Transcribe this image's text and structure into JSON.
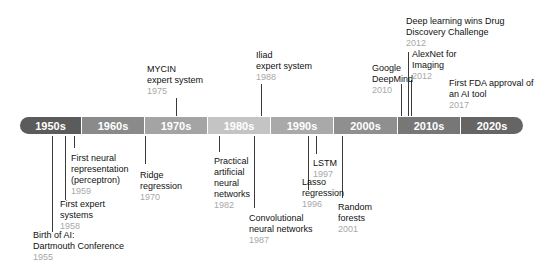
{
  "decades": [
    {
      "label": "1950s",
      "color": "#5b5b5b"
    },
    {
      "label": "1960s",
      "color": "#8a8a8a"
    },
    {
      "label": "1970s",
      "color": "#a4a4a4"
    },
    {
      "label": "1980s",
      "color": "#c4c4c4"
    },
    {
      "label": "1990s",
      "color": "#a9a9a9"
    },
    {
      "label": "2000s",
      "color": "#8f8f8f"
    },
    {
      "label": "2010s",
      "color": "#777777"
    },
    {
      "label": "2020s",
      "color": "#656565"
    }
  ],
  "events_above": [
    {
      "lines": [
        "MYCIN",
        "expert system"
      ],
      "year": "1975"
    },
    {
      "lines": [
        "Iliad",
        "expert system"
      ],
      "year": "1988"
    },
    {
      "lines": [
        "Google",
        "DeepMind"
      ],
      "year": "2010"
    },
    {
      "lines": [
        "Deep learning wins Drug",
        "Discovery Challenge"
      ],
      "year": "2012"
    },
    {
      "lines": [
        "AlexNet for",
        "Imaging"
      ],
      "year": "2012"
    },
    {
      "lines": [
        "First FDA approval of",
        "an AI tool"
      ],
      "year": "2017"
    }
  ],
  "events_below": [
    {
      "lines": [
        "Birth of AI:",
        "Dartmouth Conference"
      ],
      "year": "1955"
    },
    {
      "lines": [
        "First expert",
        "systems"
      ],
      "year": "1958"
    },
    {
      "lines": [
        "First neural",
        "representation",
        "(perceptron)"
      ],
      "year": "1959"
    },
    {
      "lines": [
        "Ridge",
        "regression"
      ],
      "year": "1970"
    },
    {
      "lines": [
        "Practical",
        "artificial",
        "neural",
        "networks"
      ],
      "year": "1982"
    },
    {
      "lines": [
        "Convolutional",
        "neural networks"
      ],
      "year": "1987"
    },
    {
      "lines": [
        "Lasso",
        "regression"
      ],
      "year": "1996"
    },
    {
      "lines": [
        "LSTM"
      ],
      "year": "1997"
    },
    {
      "lines": [
        "Random",
        "forests"
      ],
      "year": "2001"
    }
  ]
}
